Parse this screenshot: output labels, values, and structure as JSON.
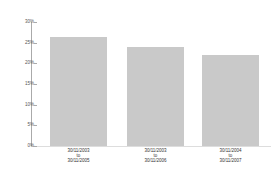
{
  "caption": "",
  "chart_data": {
    "type": "bar",
    "title": "",
    "xlabel": "",
    "ylabel": "",
    "categories": [
      "30/11/2003 to 30/11/2005",
      "30/11/2003 to 30/11/2006",
      "30/11/2004 to 30/11/2007"
    ],
    "category_lines": [
      [
        "30/11/2003",
        "to",
        "30/11/2005"
      ],
      [
        "30/11/2003",
        "to",
        "30/11/2006"
      ],
      [
        "30/11/2004",
        "to",
        "30/11/2007"
      ]
    ],
    "values": [
      26.4,
      24.0,
      22.0
    ],
    "ylim": [
      0,
      30
    ],
    "yticks": [
      "30%",
      "25%",
      "20%",
      "15%",
      "10%",
      "5%",
      "0%"
    ],
    "grid": false,
    "legend": null,
    "bar_color": "#c9c9c9"
  }
}
